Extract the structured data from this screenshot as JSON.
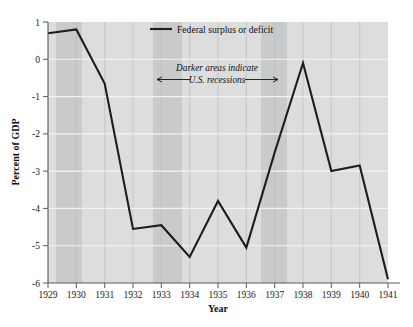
{
  "chart_data": {
    "type": "line",
    "title": "",
    "xlabel": "Year",
    "ylabel": "Percent of GDP",
    "categories": [
      "1929",
      "1930",
      "1931",
      "1932",
      "1933",
      "1934",
      "1935",
      "1936",
      "1937",
      "1938",
      "1939",
      "1940",
      "1941"
    ],
    "x": [
      1929,
      1930,
      1931,
      1932,
      1933,
      1934,
      1935,
      1936,
      1937,
      1938,
      1939,
      1940,
      1941
    ],
    "values": [
      0.7,
      0.8,
      -0.65,
      -4.55,
      -4.45,
      -5.3,
      -3.8,
      -5.05,
      -2.5,
      -0.1,
      -3.0,
      -2.85,
      -5.9
    ],
    "series": [
      {
        "name": "Federal surplus or deficit",
        "values": [
          0.7,
          0.8,
          -0.65,
          -4.55,
          -4.45,
          -5.3,
          -3.8,
          -5.05,
          -2.5,
          -0.1,
          -3.0,
          -2.85,
          -5.9
        ]
      }
    ],
    "ylim": [
      -6,
      1
    ],
    "xlim": [
      1929,
      1941
    ],
    "ytick_labels": [
      "1",
      "0",
      "-1",
      "-2",
      "-3",
      "-4",
      "-5",
      "-6"
    ],
    "yticks": [
      1,
      0,
      -1,
      -2,
      -3,
      -4,
      -5,
      -6
    ],
    "xtick_labels": [
      "1929",
      "1930",
      "1931",
      "1932",
      "1933",
      "1934",
      "1935",
      "1936",
      "1937",
      "1938",
      "1939",
      "1940",
      "1941"
    ],
    "grid": "vertical-and-horizontal",
    "legend": {
      "position": "top-center",
      "entries": [
        "Federal surplus or deficit"
      ]
    },
    "annotations": [
      {
        "line1": "Darker areas indicate",
        "line2": "U.S. recessions",
        "style": "italic",
        "arrows": "both"
      }
    ],
    "shaded_regions": [
      {
        "label": "recession",
        "start": 1929.3,
        "end": 1930.3
      },
      {
        "label": "recession",
        "start": 1933.1,
        "end": 1934.2
      },
      {
        "label": "recession",
        "start": 1937.3,
        "end": 1938.3
      }
    ],
    "colors": {
      "plot_background": "#dcdddd",
      "recession_band": "#c9cacb",
      "line": "#1d1d1d",
      "axis": "#555a5d",
      "gridline_vertical": "#b9bcbe",
      "gridline_horizontal": "#f2f3f3",
      "text": "#101113"
    }
  },
  "axis": {
    "y_title": "Percent of GDP",
    "x_title": "Year"
  },
  "legend": {
    "entry_label": "Federal surplus or deficit"
  },
  "annotation": {
    "line1": "Darker areas indicate",
    "line2": "U.S. recessions"
  }
}
